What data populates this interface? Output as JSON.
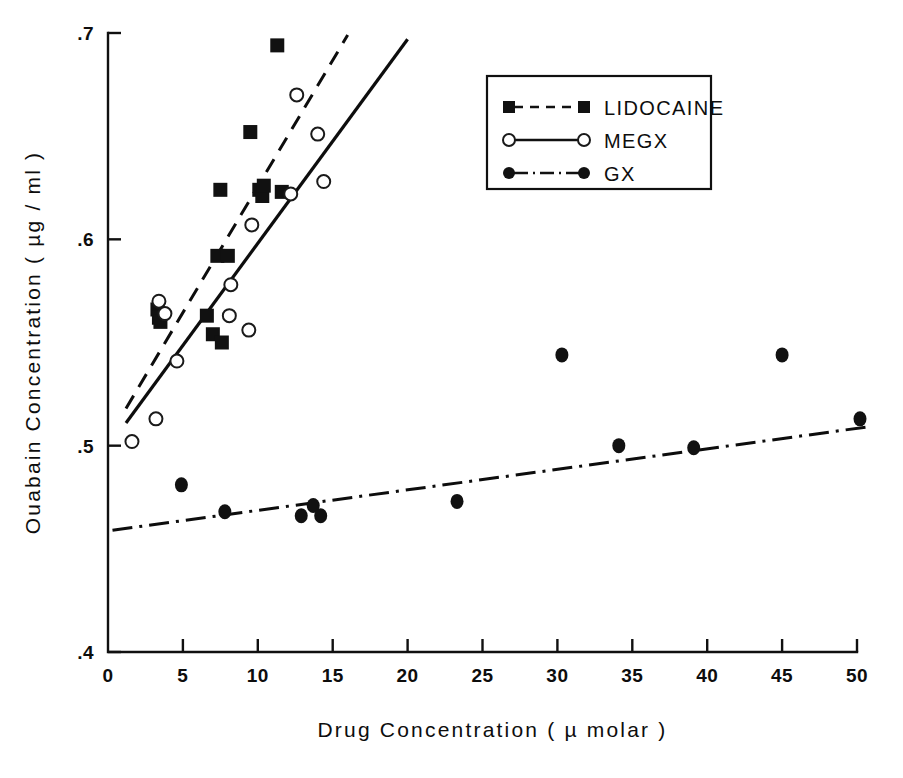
{
  "figure": {
    "background": "#ffffff",
    "ink_color": "#111111"
  },
  "axes": {
    "x": {
      "label": "Drug Concentration ( µ molar )",
      "ticks": [
        "0",
        "5",
        "10",
        "15",
        "20",
        "25",
        "30",
        "35",
        "40",
        "45",
        "50"
      ],
      "tick_values": [
        0,
        5,
        10,
        15,
        20,
        25,
        30,
        35,
        40,
        45,
        50
      ],
      "min": 0,
      "max": 50
    },
    "y": {
      "label": "Ouabain Concentration ( µg / ml )",
      "ticks": [
        ".4",
        ".5",
        ".6",
        ".7"
      ],
      "tick_values": [
        0.4,
        0.5,
        0.6,
        0.7
      ],
      "min": 0.4,
      "max": 0.7
    }
  },
  "legend": {
    "position": "upper-right",
    "entries": [
      {
        "label": "LIDOCAINE",
        "marker": "filled-square",
        "line": "dashed"
      },
      {
        "label": "MEGX",
        "marker": "open-circle",
        "line": "solid"
      },
      {
        "label": "GX",
        "marker": "filled-circle",
        "line": "dash-dot"
      }
    ]
  },
  "chart_data": {
    "type": "scatter",
    "title": "",
    "xlabel": "Drug Concentration ( µ molar )",
    "ylabel": "Ouabain Concentration ( µg / ml )",
    "xlim": [
      0,
      50
    ],
    "ylim": [
      0.4,
      0.7
    ],
    "xticks": [
      0,
      5,
      10,
      15,
      20,
      25,
      30,
      35,
      40,
      45,
      50
    ],
    "yticks": [
      0.4,
      0.5,
      0.6,
      0.7
    ],
    "grid": false,
    "legend_position": "upper-right",
    "series": [
      {
        "name": "LIDOCAINE",
        "marker": "filled-square",
        "line_style": "dashed",
        "points": [
          {
            "x": 3.3,
            "y": 0.566
          },
          {
            "x": 3.4,
            "y": 0.562
          },
          {
            "x": 3.5,
            "y": 0.56
          },
          {
            "x": 6.6,
            "y": 0.563
          },
          {
            "x": 7.0,
            "y": 0.554
          },
          {
            "x": 7.6,
            "y": 0.55
          },
          {
            "x": 7.3,
            "y": 0.592
          },
          {
            "x": 8.0,
            "y": 0.592
          },
          {
            "x": 7.5,
            "y": 0.624
          },
          {
            "x": 9.5,
            "y": 0.652
          },
          {
            "x": 10.1,
            "y": 0.624
          },
          {
            "x": 10.3,
            "y": 0.621
          },
          {
            "x": 10.4,
            "y": 0.626
          },
          {
            "x": 11.6,
            "y": 0.623
          },
          {
            "x": 11.3,
            "y": 0.694
          }
        ],
        "fit_line": {
          "x1": 1.2,
          "y1": 0.518,
          "x2": 16.0,
          "y2": 0.699
        }
      },
      {
        "name": "MEGX",
        "marker": "open-circle",
        "line_style": "solid",
        "points": [
          {
            "x": 1.6,
            "y": 0.502
          },
          {
            "x": 3.2,
            "y": 0.513
          },
          {
            "x": 3.4,
            "y": 0.57
          },
          {
            "x": 3.8,
            "y": 0.564
          },
          {
            "x": 4.6,
            "y": 0.541
          },
          {
            "x": 8.2,
            "y": 0.578
          },
          {
            "x": 8.1,
            "y": 0.563
          },
          {
            "x": 9.4,
            "y": 0.556
          },
          {
            "x": 9.6,
            "y": 0.607
          },
          {
            "x": 12.2,
            "y": 0.622
          },
          {
            "x": 12.6,
            "y": 0.67
          },
          {
            "x": 14.0,
            "y": 0.651
          },
          {
            "x": 14.4,
            "y": 0.628
          }
        ],
        "fit_line": {
          "x1": 1.2,
          "y1": 0.511,
          "x2": 20.0,
          "y2": 0.697
        }
      },
      {
        "name": "GX",
        "marker": "filled-circle",
        "line_style": "dash-dot",
        "points": [
          {
            "x": 4.9,
            "y": 0.481
          },
          {
            "x": 7.8,
            "y": 0.468
          },
          {
            "x": 12.9,
            "y": 0.466
          },
          {
            "x": 13.7,
            "y": 0.471
          },
          {
            "x": 14.2,
            "y": 0.466
          },
          {
            "x": 23.3,
            "y": 0.473
          },
          {
            "x": 30.3,
            "y": 0.544
          },
          {
            "x": 34.1,
            "y": 0.5
          },
          {
            "x": 39.1,
            "y": 0.499
          },
          {
            "x": 45.0,
            "y": 0.544
          },
          {
            "x": 50.2,
            "y": 0.513
          }
        ],
        "fit_line": {
          "x1": 0.3,
          "y1": 0.459,
          "x2": 50.6,
          "y2": 0.509
        }
      }
    ]
  }
}
